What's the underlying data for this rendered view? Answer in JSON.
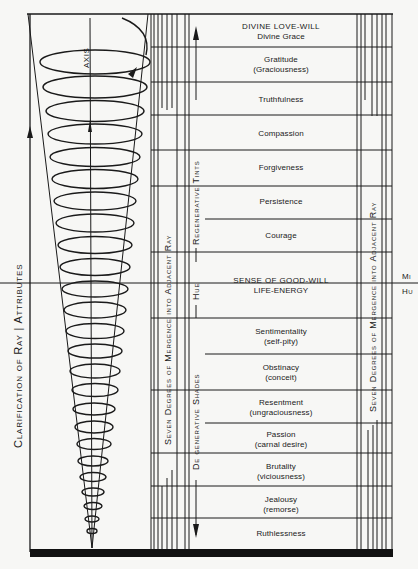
{
  "title_vertical": "Clarification of Ray | Attributes",
  "title_parts": [
    "Clarification of Ray",
    "Attributes"
  ],
  "axis_label": "AXIS",
  "left_band_label": "Seven Degrees of Mergence into Adjacent Ray",
  "right_band_label": "Seven Degrees of Mergence into Adjacent Ray",
  "center_band": {
    "upper": "Regenerative Tints",
    "middle": "Hue",
    "lower": "De generative Shades"
  },
  "edge_fragments": [
    "Mi",
    "Hu"
  ],
  "rows": [
    {
      "label": "DIVINE LOVE-WILL",
      "sub": "Divine Grace",
      "group": "regenerative"
    },
    {
      "label": "Gratitude",
      "sub": "(Graciousness)",
      "group": "regenerative"
    },
    {
      "label": "Truthfulness",
      "sub": "",
      "group": "regenerative"
    },
    {
      "label": "Compassion",
      "sub": "",
      "group": "regenerative"
    },
    {
      "label": "Forgiveness",
      "sub": "",
      "group": "regenerative"
    },
    {
      "label": "Persistence",
      "sub": "",
      "group": "regenerative"
    },
    {
      "label": "Courage",
      "sub": "",
      "group": "regenerative"
    },
    {
      "label": "SENSE OF GOOD-WILL",
      "sub": "LIFE-ENERGY",
      "group": "hue"
    },
    {
      "label": "Sentimentality",
      "sub": "(self-pity)",
      "group": "degenerative"
    },
    {
      "label": "Obstinacy",
      "sub": "(conceit)",
      "group": "degenerative"
    },
    {
      "label": "Resentment",
      "sub": "(ungraciousness)",
      "group": "degenerative"
    },
    {
      "label": "Passion",
      "sub": "(carnal desire)",
      "group": "degenerative"
    },
    {
      "label": "Brutality",
      "sub": "(viciousness)",
      "group": "degenerative"
    },
    {
      "label": "Jealousy",
      "sub": "(remorse)",
      "group": "degenerative"
    },
    {
      "label": "Ruthlessness",
      "sub": "",
      "group": "degenerative"
    }
  ],
  "colors": {
    "ink": "#1a1a1a",
    "paper": "#f7f7f5"
  }
}
